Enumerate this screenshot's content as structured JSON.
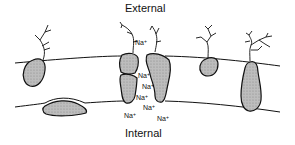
{
  "diagram": {
    "labels": {
      "external": "External",
      "internal": "Internal"
    },
    "ion": {
      "symbol": "Na",
      "charge": "+"
    },
    "ions": [
      {
        "x": 133,
        "y": 41
      },
      {
        "x": 138,
        "y": 73
      },
      {
        "x": 141,
        "y": 84
      },
      {
        "x": 135,
        "y": 95
      },
      {
        "x": 142,
        "y": 105
      },
      {
        "x": 123,
        "y": 113
      },
      {
        "x": 157,
        "y": 115
      }
    ],
    "colors": {
      "line": "#111111",
      "protein_fill": "#b8b8b8",
      "background": "#ffffff"
    }
  }
}
